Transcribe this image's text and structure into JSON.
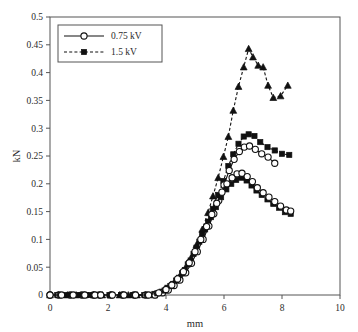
{
  "chart_data": {
    "type": "line",
    "title": "",
    "xlabel": "mm",
    "ylabel": "kN",
    "xlim": [
      0,
      10
    ],
    "ylim": [
      0,
      0.5
    ],
    "xticks": [
      "0",
      "2",
      "4",
      "6",
      "8",
      "10"
    ],
    "xtick_values": [
      0,
      2,
      4,
      6,
      8,
      10
    ],
    "yticks": [
      "0",
      "0.05",
      "0.1",
      "0.15",
      "0.2",
      "0.25",
      "0.3",
      "0.35",
      "0.4",
      "0.45",
      "0.5"
    ],
    "ytick_values": [
      0,
      0.05,
      0.1,
      0.15,
      0.2,
      0.25,
      0.3,
      0.35,
      0.4,
      0.45,
      0.5
    ],
    "grid": false,
    "legend_position": "upper left",
    "legend": [
      {
        "label": "0.75 kV",
        "marker": "open-circle",
        "line": "solid"
      },
      {
        "label": "1.5 kV",
        "marker": "filled-square",
        "line": "dashed"
      }
    ],
    "series": [
      {
        "name": "1.5 kV (triangle, high)",
        "marker": "filled-triangle",
        "line": "dashed",
        "x": [
          0.0,
          0.3,
          0.6,
          0.9,
          1.2,
          1.5,
          1.8,
          2.1,
          2.4,
          2.7,
          3.0,
          3.3,
          3.6,
          3.85,
          4.05,
          4.25,
          4.45,
          4.65,
          4.85,
          5.05,
          5.25,
          5.45,
          5.62,
          5.8,
          5.98,
          6.15,
          6.32,
          6.5,
          6.68,
          6.85,
          7.0,
          7.18,
          7.35,
          7.52,
          7.7,
          7.95,
          8.2
        ],
        "y": [
          0.0,
          0.0,
          0.0,
          0.0,
          0.0,
          0.0,
          0.0,
          0.0,
          0.0,
          0.0,
          0.0,
          0.0,
          0.0,
          0.004,
          0.012,
          0.02,
          0.032,
          0.047,
          0.066,
          0.09,
          0.118,
          0.148,
          0.178,
          0.211,
          0.249,
          0.285,
          0.332,
          0.375,
          0.41,
          0.443,
          0.428,
          0.413,
          0.41,
          0.377,
          0.355,
          0.358,
          0.377
        ]
      },
      {
        "name": "1.5 kV (square, mid)",
        "marker": "filled-square",
        "line": "dashed",
        "x": [
          0.0,
          0.25,
          0.5,
          0.75,
          1.0,
          1.25,
          1.5,
          1.7,
          2.05,
          2.45,
          2.85,
          3.25,
          3.6,
          3.85,
          4.05,
          4.25,
          4.45,
          4.65,
          4.85,
          5.05,
          5.25,
          5.45,
          5.62,
          5.8,
          5.98,
          6.15,
          6.32,
          6.5,
          6.68,
          6.85,
          7.05,
          7.25,
          7.5,
          7.75,
          8.0,
          8.25
        ],
        "y": [
          0.0,
          0.0,
          0.0,
          0.0,
          0.0,
          0.0,
          0.0,
          0.0,
          0.0,
          0.0,
          0.0,
          0.0,
          0.002,
          0.006,
          0.013,
          0.02,
          0.031,
          0.045,
          0.062,
          0.085,
          0.109,
          0.132,
          0.155,
          0.18,
          0.205,
          0.232,
          0.253,
          0.272,
          0.285,
          0.289,
          0.286,
          0.275,
          0.266,
          0.26,
          0.254,
          0.252
        ]
      },
      {
        "name": "0.75 kV (circle, mid)",
        "marker": "open-circle",
        "line": "solid",
        "x": [
          0.0,
          0.3,
          0.7,
          1.1,
          1.5,
          1.7,
          2.1,
          2.5,
          2.9,
          3.3,
          3.62,
          3.88,
          4.08,
          4.28,
          4.48,
          4.68,
          4.88,
          5.08,
          5.28,
          5.48,
          5.65,
          5.82,
          6.0,
          6.18,
          6.35,
          6.53,
          6.7,
          6.88,
          7.08,
          7.3,
          7.52,
          7.75
        ],
        "y": [
          0.0,
          0.0,
          0.0,
          0.0,
          0.0,
          0.0,
          0.0,
          0.0,
          0.0,
          0.0,
          0.0,
          0.004,
          0.009,
          0.017,
          0.027,
          0.04,
          0.057,
          0.078,
          0.1,
          0.124,
          0.146,
          0.17,
          0.198,
          0.224,
          0.244,
          0.258,
          0.266,
          0.268,
          0.262,
          0.254,
          0.248,
          0.237
        ]
      },
      {
        "name": "1.5 kV (square, low)",
        "marker": "filled-square",
        "line": "dashed",
        "x": [
          0.0,
          0.35,
          0.7,
          1.05,
          1.4,
          1.7,
          2.1,
          2.5,
          2.9,
          3.35,
          3.7,
          3.95,
          4.15,
          4.35,
          4.55,
          4.75,
          4.95,
          5.15,
          5.35,
          5.55,
          5.72,
          5.9,
          6.08,
          6.25,
          6.42,
          6.6,
          6.78,
          6.95,
          7.12,
          7.3,
          7.5,
          7.7,
          7.9,
          8.1,
          8.3
        ],
        "y": [
          0.0,
          0.0,
          0.0,
          0.0,
          0.0,
          0.0,
          0.0,
          0.0,
          0.0,
          0.0,
          0.003,
          0.008,
          0.016,
          0.026,
          0.039,
          0.055,
          0.074,
          0.096,
          0.118,
          0.14,
          0.158,
          0.176,
          0.19,
          0.2,
          0.207,
          0.211,
          0.206,
          0.197,
          0.188,
          0.18,
          0.172,
          0.164,
          0.157,
          0.149,
          0.146
        ]
      },
      {
        "name": "0.75 kV (circle, low)",
        "marker": "open-circle",
        "line": "solid",
        "x": [
          0.0,
          0.4,
          0.8,
          1.2,
          1.55,
          1.75,
          2.15,
          2.55,
          2.95,
          3.4,
          3.75,
          4.0,
          4.2,
          4.4,
          4.6,
          4.8,
          5.0,
          5.2,
          5.4,
          5.58,
          5.75,
          5.93,
          6.1,
          6.28,
          6.45,
          6.62,
          6.8,
          6.98,
          7.15,
          7.35,
          7.55,
          7.75,
          7.95,
          8.15,
          8.3
        ],
        "y": [
          0.0,
          0.0,
          0.0,
          0.0,
          0.0,
          0.0,
          0.0,
          0.0,
          0.0,
          0.0,
          0.004,
          0.01,
          0.018,
          0.029,
          0.042,
          0.058,
          0.078,
          0.1,
          0.123,
          0.145,
          0.165,
          0.185,
          0.2,
          0.211,
          0.218,
          0.219,
          0.213,
          0.204,
          0.193,
          0.184,
          0.176,
          0.168,
          0.16,
          0.153,
          0.151
        ]
      }
    ]
  }
}
